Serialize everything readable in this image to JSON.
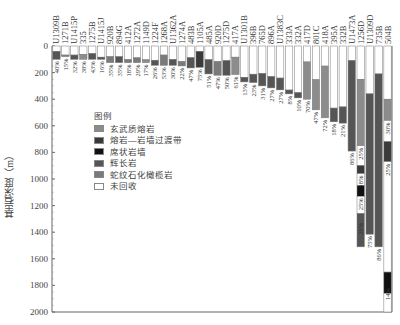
{
  "chart_data": {
    "type": "bar",
    "subtype": "stacked-column-depth",
    "title": "",
    "ylabel": "基岩深度（m）",
    "xlabel": "",
    "ylim": [
      0,
      2000
    ],
    "y_ticks": [
      0,
      200,
      400,
      600,
      800,
      1000,
      1200,
      1400,
      1600,
      1800,
      2000
    ],
    "y_inverted": true,
    "legend_title": "图例",
    "legend": [
      {
        "key": "basalt",
        "label": "玄武质熔岩",
        "color": "#8c8c8c"
      },
      {
        "key": "transition",
        "label": "熔岩—岩墙过渡带",
        "color": "#3a3a3a"
      },
      {
        "key": "dike",
        "label": "席状岩墙",
        "color": "#111111"
      },
      {
        "key": "gabbro",
        "label": "辉长岩",
        "color": "#555555"
      },
      {
        "key": "serpentinite",
        "label": "蛇纹石化橄榄岩",
        "color": "#7a7a7a"
      },
      {
        "key": "unrecovered",
        "label": "未回收",
        "color": "#ffffff"
      }
    ],
    "categories": [
      "U1309B",
      "1271B",
      "U1415P",
      "335",
      "1275B",
      "U1415J",
      "920B",
      "894G",
      "412A",
      "1272A",
      "1149D",
      "1224F",
      "1268A",
      "U1362A",
      "1274A",
      "483B",
      "1105A",
      "485A",
      "920D",
      "1275D",
      "417A",
      "U1301B",
      "396B",
      "765D",
      "896A",
      "U1383C",
      "333A",
      "332A",
      "417D",
      "801C",
      "418A",
      "395A",
      "332B",
      "U1473A",
      "1256D",
      "U1309D",
      "735B",
      "504B"
    ],
    "columns": [
      {
        "site": "U1309B",
        "depth": 100,
        "recovery": "40%",
        "segments": [
          {
            "type": "unrecovered",
            "from": 0,
            "to": 40
          },
          {
            "type": "gabbro",
            "from": 40,
            "to": 100
          }
        ]
      },
      {
        "site": "1271B",
        "depth": 80,
        "recovery": "15%",
        "segments": [
          {
            "type": "unrecovered",
            "from": 0,
            "to": 68
          },
          {
            "type": "serpentinite",
            "from": 68,
            "to": 80
          }
        ]
      },
      {
        "site": "U1415P",
        "depth": 100,
        "recovery": "32%",
        "segments": [
          {
            "type": "unrecovered",
            "from": 0,
            "to": 68
          },
          {
            "type": "gabbro",
            "from": 68,
            "to": 100
          }
        ]
      },
      {
        "site": "335",
        "depth": 100,
        "recovery": "38%",
        "segments": [
          {
            "type": "unrecovered",
            "from": 0,
            "to": 62
          },
          {
            "type": "basalt",
            "from": 62,
            "to": 100
          }
        ]
      },
      {
        "site": "1275B",
        "depth": 100,
        "recovery": "43%",
        "segments": [
          {
            "type": "unrecovered",
            "from": 0,
            "to": 57
          },
          {
            "type": "gabbro",
            "from": 57,
            "to": 100
          }
        ]
      },
      {
        "site": "U1415J",
        "depth": 100,
        "recovery": "16%",
        "segments": [
          {
            "type": "unrecovered",
            "from": 0,
            "to": 84
          },
          {
            "type": "gabbro",
            "from": 84,
            "to": 100
          }
        ]
      },
      {
        "site": "920B",
        "depth": 125,
        "recovery": "35%",
        "segments": [
          {
            "type": "unrecovered",
            "from": 0,
            "to": 81
          },
          {
            "type": "serpentinite",
            "from": 81,
            "to": 125
          }
        ]
      },
      {
        "site": "894G",
        "depth": 125,
        "recovery": "35%",
        "segments": [
          {
            "type": "unrecovered",
            "from": 0,
            "to": 81
          },
          {
            "type": "gabbro",
            "from": 81,
            "to": 125
          }
        ]
      },
      {
        "site": "412A",
        "depth": 125,
        "recovery": "18%",
        "segments": [
          {
            "type": "unrecovered",
            "from": 0,
            "to": 103
          },
          {
            "type": "serpentinite",
            "from": 103,
            "to": 125
          }
        ]
      },
      {
        "site": "1272A",
        "depth": 125,
        "recovery": "29%",
        "segments": [
          {
            "type": "unrecovered",
            "from": 0,
            "to": 89
          },
          {
            "type": "serpentinite",
            "from": 89,
            "to": 125
          }
        ]
      },
      {
        "site": "1149D",
        "depth": 125,
        "recovery": "17%",
        "segments": [
          {
            "type": "unrecovered",
            "from": 0,
            "to": 104
          },
          {
            "type": "basalt",
            "from": 104,
            "to": 125
          }
        ]
      },
      {
        "site": "1224F",
        "depth": 145,
        "recovery": "26%",
        "segments": [
          {
            "type": "unrecovered",
            "from": 0,
            "to": 107
          },
          {
            "type": "gabbro",
            "from": 107,
            "to": 145
          }
        ]
      },
      {
        "site": "1268A",
        "depth": 145,
        "recovery": "53%",
        "segments": [
          {
            "type": "unrecovered",
            "from": 0,
            "to": 68
          },
          {
            "type": "serpentinite",
            "from": 68,
            "to": 145
          }
        ]
      },
      {
        "site": "U1362A",
        "depth": 145,
        "recovery": "30%",
        "segments": [
          {
            "type": "unrecovered",
            "from": 0,
            "to": 101
          },
          {
            "type": "gabbro",
            "from": 101,
            "to": 145
          }
        ]
      },
      {
        "site": "1274A",
        "depth": 150,
        "recovery": "22%",
        "segments": [
          {
            "type": "unrecovered",
            "from": 0,
            "to": 117
          },
          {
            "type": "serpentinite",
            "from": 117,
            "to": 150
          }
        ]
      },
      {
        "site": "483B",
        "depth": 165,
        "recovery": "47%",
        "segments": [
          {
            "type": "unrecovered",
            "from": 0,
            "to": 88
          },
          {
            "type": "gabbro",
            "from": 88,
            "to": 165
          }
        ]
      },
      {
        "site": "1105A",
        "depth": 160,
        "recovery": "75%",
        "segments": [
          {
            "type": "unrecovered",
            "from": 0,
            "to": 40
          },
          {
            "type": "transition",
            "from": 40,
            "to": 160
          }
        ]
      },
      {
        "site": "485A",
        "depth": 210,
        "recovery": "51%",
        "segments": [
          {
            "type": "unrecovered",
            "from": 0,
            "to": 103
          },
          {
            "type": "gabbro",
            "from": 103,
            "to": 210
          }
        ]
      },
      {
        "site": "920D",
        "depth": 220,
        "recovery": "47%",
        "segments": [
          {
            "type": "unrecovered",
            "from": 0,
            "to": 117
          },
          {
            "type": "serpentinite",
            "from": 117,
            "to": 220
          }
        ]
      },
      {
        "site": "1275D",
        "depth": 220,
        "recovery": "50%",
        "segments": [
          {
            "type": "unrecovered",
            "from": 0,
            "to": 110
          },
          {
            "type": "gabbro",
            "from": 110,
            "to": 220
          }
        ]
      },
      {
        "site": "417A",
        "depth": 215,
        "recovery": "61%",
        "segments": [
          {
            "type": "unrecovered",
            "from": 0,
            "to": 84
          },
          {
            "type": "basalt",
            "from": 84,
            "to": 215
          }
        ]
      },
      {
        "site": "U1301B",
        "depth": 270,
        "recovery": "13%",
        "segments": [
          {
            "type": "unrecovered",
            "from": 0,
            "to": 235
          },
          {
            "type": "gabbro",
            "from": 235,
            "to": 270
          }
        ]
      },
      {
        "site": "396B",
        "depth": 275,
        "recovery": "23%",
        "segments": [
          {
            "type": "unrecovered",
            "from": 0,
            "to": 212
          },
          {
            "type": "gabbro",
            "from": 212,
            "to": 275
          }
        ]
      },
      {
        "site": "765D",
        "depth": 300,
        "recovery": "31%",
        "segments": [
          {
            "type": "unrecovered",
            "from": 0,
            "to": 207
          },
          {
            "type": "gabbro",
            "from": 207,
            "to": 300
          }
        ]
      },
      {
        "site": "896A",
        "depth": 315,
        "recovery": "27%",
        "segments": [
          {
            "type": "unrecovered",
            "from": 0,
            "to": 230
          },
          {
            "type": "gabbro",
            "from": 230,
            "to": 315
          }
        ]
      },
      {
        "site": "U1383C",
        "depth": 330,
        "recovery": "27%",
        "segments": [
          {
            "type": "unrecovered",
            "from": 0,
            "to": 241
          },
          {
            "type": "gabbro",
            "from": 241,
            "to": 330
          }
        ]
      },
      {
        "site": "333A",
        "depth": 360,
        "recovery": "8%",
        "segments": [
          {
            "type": "unrecovered",
            "from": 0,
            "to": 331
          },
          {
            "type": "gabbro",
            "from": 331,
            "to": 360
          }
        ]
      },
      {
        "site": "332A",
        "depth": 390,
        "recovery": "10%",
        "segments": [
          {
            "type": "unrecovered",
            "from": 0,
            "to": 351
          },
          {
            "type": "gabbro",
            "from": 351,
            "to": 390
          }
        ]
      },
      {
        "site": "417D",
        "depth": 400,
        "recovery": "70%",
        "segments": [
          {
            "type": "unrecovered",
            "from": 0,
            "to": 120
          },
          {
            "type": "basalt",
            "from": 120,
            "to": 400
          }
        ]
      },
      {
        "site": "801C",
        "depth": 480,
        "recovery": "47%",
        "segments": [
          {
            "type": "unrecovered",
            "from": 0,
            "to": 254
          },
          {
            "type": "basalt",
            "from": 254,
            "to": 480
          }
        ]
      },
      {
        "site": "418A",
        "depth": 540,
        "recovery": "72%",
        "segments": [
          {
            "type": "unrecovered",
            "from": 0,
            "to": 151
          },
          {
            "type": "basalt",
            "from": 151,
            "to": 540
          }
        ]
      },
      {
        "site": "395A",
        "depth": 570,
        "recovery": "18%",
        "segments": [
          {
            "type": "unrecovered",
            "from": 0,
            "to": 467
          },
          {
            "type": "gabbro",
            "from": 467,
            "to": 570
          }
        ]
      },
      {
        "site": "332B",
        "depth": 580,
        "recovery": "21%",
        "segments": [
          {
            "type": "unrecovered",
            "from": 0,
            "to": 458
          },
          {
            "type": "gabbro",
            "from": 458,
            "to": 580
          }
        ]
      },
      {
        "site": "U1473A",
        "depth": 790,
        "recovery": "86%",
        "segments": [
          {
            "type": "unrecovered",
            "from": 0,
            "to": 110
          },
          {
            "type": "gabbro",
            "from": 110,
            "to": 790
          }
        ]
      },
      {
        "site": "1256D",
        "depth": 1510,
        "recovery": "25%",
        "segments": [
          {
            "type": "unrecovered",
            "from": 0,
            "to": 250
          },
          {
            "type": "basalt",
            "from": 250,
            "to": 750
          },
          {
            "type": "unrecovered",
            "from": 750,
            "to": 900
          },
          {
            "type": "transition",
            "from": 900,
            "to": 960
          },
          {
            "type": "unrecovered",
            "from": 960,
            "to": 1050
          },
          {
            "type": "dike",
            "from": 1050,
            "to": 1130
          },
          {
            "type": "unrecovered",
            "from": 1130,
            "to": 1260
          },
          {
            "type": "gabbro",
            "from": 1260,
            "to": 1510
          }
        ],
        "segment_labels": [
          "25%",
          "18%",
          "25%",
          "28%"
        ]
      },
      {
        "site": "U1309D",
        "depth": 1415,
        "recovery": "75%",
        "segments": [
          {
            "type": "unrecovered",
            "from": 0,
            "to": 360
          },
          {
            "type": "gabbro",
            "from": 360,
            "to": 1415
          }
        ]
      },
      {
        "site": "735B",
        "depth": 1510,
        "recovery": "86%",
        "segments": [
          {
            "type": "unrecovered",
            "from": 0,
            "to": 210
          },
          {
            "type": "gabbro",
            "from": 210,
            "to": 1510
          }
        ]
      },
      {
        "site": "504B",
        "depth": 2111,
        "recovery": "14%",
        "segments": [
          {
            "type": "unrecovered",
            "from": 0,
            "to": 400
          },
          {
            "type": "basalt",
            "from": 400,
            "to": 560
          },
          {
            "type": "unrecovered",
            "from": 560,
            "to": 720
          },
          {
            "type": "transition",
            "from": 720,
            "to": 870
          },
          {
            "type": "unrecovered",
            "from": 870,
            "to": 1700
          },
          {
            "type": "dike",
            "from": 1700,
            "to": 1860
          },
          {
            "type": "unrecovered",
            "from": 1860,
            "to": 2000
          }
        ],
        "segment_labels": [
          "30%",
          "25%",
          "14%"
        ]
      }
    ],
    "grid": false,
    "legend_position": "inside-left"
  }
}
